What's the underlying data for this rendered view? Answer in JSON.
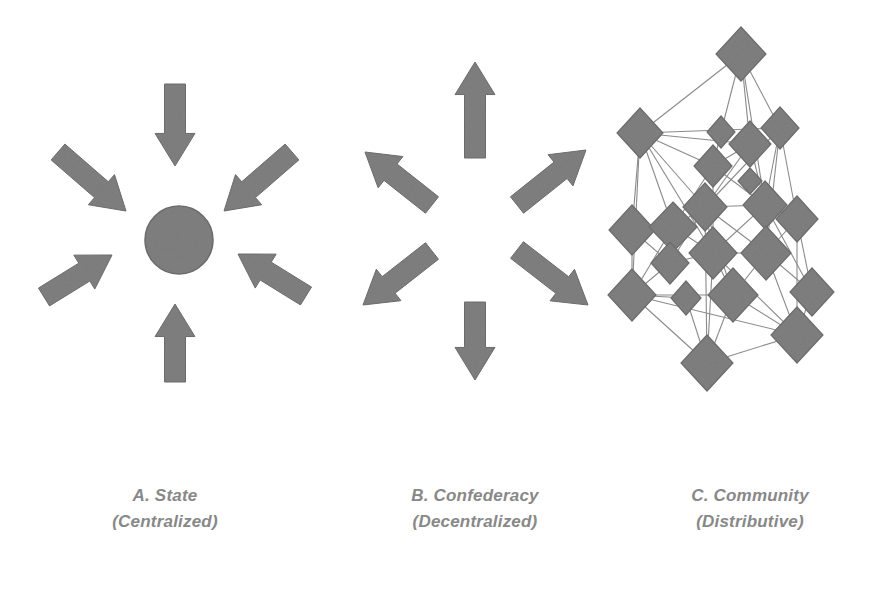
{
  "figure": {
    "background_color": "#ffffff",
    "shape_fill": "#808080",
    "shape_stroke": "#6e6e6e",
    "edge_color": "#8a8a8a",
    "caption_color": "#888888"
  },
  "panels": [
    {
      "id": "panel-a",
      "label": "A.  State",
      "sublabel": "(Centralized)",
      "kind": "centralized",
      "center": {
        "cx": 179,
        "cy": 240,
        "r": 34
      },
      "arrows": [
        {
          "name": "arrow-top-inward",
          "x1": 175,
          "y1": 84,
          "x2": 175,
          "y2": 166,
          "width": 21
        },
        {
          "name": "arrow-bottom-inward",
          "x1": 175,
          "y1": 382,
          "x2": 175,
          "y2": 304,
          "width": 21
        },
        {
          "name": "arrow-upper-left-inward",
          "x1": 58,
          "y1": 152,
          "x2": 126,
          "y2": 211,
          "width": 21
        },
        {
          "name": "arrow-upper-right-inward",
          "x1": 292,
          "y1": 152,
          "x2": 224,
          "y2": 211,
          "width": 21
        },
        {
          "name": "arrow-lower-left-inward",
          "x1": 44,
          "y1": 297,
          "x2": 112,
          "y2": 255,
          "width": 21
        },
        {
          "name": "arrow-lower-right-inward",
          "x1": 306,
          "y1": 296,
          "x2": 238,
          "y2": 254,
          "width": 21
        }
      ]
    },
    {
      "id": "panel-b",
      "label": "B. Confederacy",
      "sublabel": "(Decentralized)",
      "kind": "decentralized",
      "center": null,
      "arrows": [
        {
          "name": "arrow-top-outward",
          "x1": 475,
          "y1": 158,
          "x2": 475,
          "y2": 62,
          "width": 21
        },
        {
          "name": "arrow-bottom-outward",
          "x1": 475,
          "y1": 302,
          "x2": 475,
          "y2": 380,
          "width": 21
        },
        {
          "name": "arrow-upper-left-outward",
          "x1": 432,
          "y1": 205,
          "x2": 365,
          "y2": 152,
          "width": 21
        },
        {
          "name": "arrow-upper-right-outward",
          "x1": 517,
          "y1": 205,
          "x2": 586,
          "y2": 150,
          "width": 21
        },
        {
          "name": "arrow-lower-left-outward",
          "x1": 432,
          "y1": 251,
          "x2": 363,
          "y2": 305,
          "width": 21
        },
        {
          "name": "arrow-lower-right-outward",
          "x1": 517,
          "y1": 250,
          "x2": 588,
          "y2": 305,
          "width": 21
        }
      ]
    },
    {
      "id": "panel-c",
      "label": "C. Community",
      "sublabel": "(Distributive)",
      "kind": "distributive",
      "center": null,
      "arrows": []
    }
  ],
  "network": {
    "id": "community-network",
    "node_shape": "diamond",
    "node_count": 21,
    "edge_count": 59,
    "nodes": [
      {
        "id": "n0",
        "x": 741,
        "y": 54,
        "rx": 25,
        "ry": 27
      },
      {
        "id": "n1",
        "x": 640,
        "y": 133,
        "rx": 23,
        "ry": 25
      },
      {
        "id": "n2",
        "x": 721,
        "y": 132,
        "rx": 14,
        "ry": 16
      },
      {
        "id": "n3",
        "x": 750,
        "y": 144,
        "rx": 21,
        "ry": 23
      },
      {
        "id": "n4",
        "x": 780,
        "y": 128,
        "rx": 19,
        "ry": 21
      },
      {
        "id": "n5",
        "x": 713,
        "y": 166,
        "rx": 19,
        "ry": 21
      },
      {
        "id": "n6",
        "x": 705,
        "y": 207,
        "rx": 22,
        "ry": 24
      },
      {
        "id": "n7",
        "x": 765,
        "y": 205,
        "rx": 22,
        "ry": 24
      },
      {
        "id": "n8",
        "x": 632,
        "y": 230,
        "rx": 23,
        "ry": 25
      },
      {
        "id": "n9",
        "x": 673,
        "y": 227,
        "rx": 24,
        "ry": 25
      },
      {
        "id": "n10",
        "x": 797,
        "y": 219,
        "rx": 21,
        "ry": 23
      },
      {
        "id": "n11",
        "x": 670,
        "y": 263,
        "rx": 19,
        "ry": 21
      },
      {
        "id": "n12",
        "x": 713,
        "y": 253,
        "rx": 24,
        "ry": 26
      },
      {
        "id": "n13",
        "x": 766,
        "y": 253,
        "rx": 25,
        "ry": 27
      },
      {
        "id": "n14",
        "x": 632,
        "y": 295,
        "rx": 24,
        "ry": 26
      },
      {
        "id": "n15",
        "x": 686,
        "y": 298,
        "rx": 15,
        "ry": 17
      },
      {
        "id": "n16",
        "x": 733,
        "y": 295,
        "rx": 25,
        "ry": 27
      },
      {
        "id": "n17",
        "x": 812,
        "y": 292,
        "rx": 22,
        "ry": 24
      },
      {
        "id": "n18",
        "x": 797,
        "y": 335,
        "rx": 26,
        "ry": 28
      },
      {
        "id": "n19",
        "x": 707,
        "y": 363,
        "rx": 26,
        "ry": 28
      },
      {
        "id": "n20",
        "x": 750,
        "y": 181,
        "rx": 12,
        "ry": 13
      }
    ],
    "edges": [
      [
        "n0",
        "n1"
      ],
      [
        "n0",
        "n2"
      ],
      [
        "n0",
        "n3"
      ],
      [
        "n0",
        "n4"
      ],
      [
        "n0",
        "n7"
      ],
      [
        "n1",
        "n4"
      ],
      [
        "n1",
        "n3"
      ],
      [
        "n1",
        "n6"
      ],
      [
        "n1",
        "n9"
      ],
      [
        "n1",
        "n8"
      ],
      [
        "n1",
        "n12"
      ],
      [
        "n1",
        "n14"
      ],
      [
        "n1",
        "n5"
      ],
      [
        "n2",
        "n5"
      ],
      [
        "n3",
        "n5"
      ],
      [
        "n3",
        "n6"
      ],
      [
        "n3",
        "n7"
      ],
      [
        "n4",
        "n7"
      ],
      [
        "n4",
        "n10"
      ],
      [
        "n4",
        "n13"
      ],
      [
        "n4",
        "n6"
      ],
      [
        "n5",
        "n7"
      ],
      [
        "n5",
        "n9"
      ],
      [
        "n5",
        "n12"
      ],
      [
        "n6",
        "n7"
      ],
      [
        "n6",
        "n9"
      ],
      [
        "n6",
        "n12"
      ],
      [
        "n6",
        "n13"
      ],
      [
        "n6",
        "n16"
      ],
      [
        "n6",
        "n11"
      ],
      [
        "n6",
        "n19"
      ],
      [
        "n7",
        "n10"
      ],
      [
        "n7",
        "n12"
      ],
      [
        "n7",
        "n13"
      ],
      [
        "n7",
        "n17"
      ],
      [
        "n8",
        "n9"
      ],
      [
        "n8",
        "n14"
      ],
      [
        "n8",
        "n11"
      ],
      [
        "n9",
        "n12"
      ],
      [
        "n9",
        "n11"
      ],
      [
        "n9",
        "n14"
      ],
      [
        "n10",
        "n13"
      ],
      [
        "n10",
        "n17"
      ],
      [
        "n10",
        "n18"
      ],
      [
        "n11",
        "n14"
      ],
      [
        "n11",
        "n12"
      ],
      [
        "n12",
        "n13"
      ],
      [
        "n12",
        "n16"
      ],
      [
        "n12",
        "n19"
      ],
      [
        "n12",
        "n18"
      ],
      [
        "n13",
        "n16"
      ],
      [
        "n13",
        "n17"
      ],
      [
        "n13",
        "n18"
      ],
      [
        "n14",
        "n15"
      ],
      [
        "n14",
        "n16"
      ],
      [
        "n14",
        "n19"
      ],
      [
        "n14",
        "n18"
      ],
      [
        "n15",
        "n19"
      ],
      [
        "n16",
        "n19"
      ],
      [
        "n16",
        "n18"
      ],
      [
        "n17",
        "n18"
      ],
      [
        "n18",
        "n19"
      ]
    ]
  }
}
